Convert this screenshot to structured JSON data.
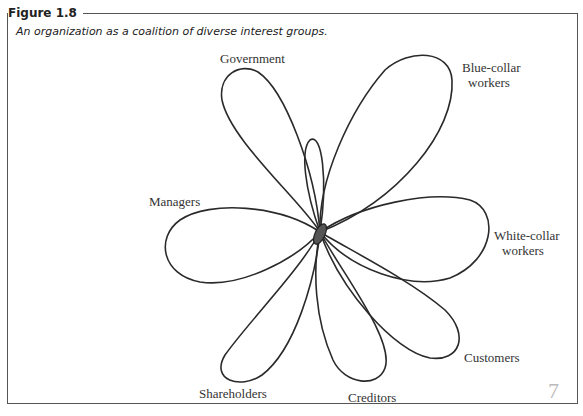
{
  "figure": {
    "number": "Figure 1.8",
    "caption": "An organization as a coalition of diverse interest groups."
  },
  "diagram": {
    "center": "organization",
    "groups": [
      {
        "label": "Government",
        "lines": [
          "Government"
        ]
      },
      {
        "label": "Blue-collar workers",
        "lines": [
          "Blue-collar",
          "workers"
        ]
      },
      {
        "label": "Managers",
        "lines": [
          "Managers"
        ]
      },
      {
        "label": "White-collar workers",
        "lines": [
          "White-collar",
          "workers"
        ]
      },
      {
        "label": "Customers",
        "lines": [
          "Customers"
        ]
      },
      {
        "label": "Shareholders",
        "lines": [
          "Shareholders"
        ]
      },
      {
        "label": "Creditors",
        "lines": [
          "Creditors"
        ]
      }
    ]
  },
  "margin_mark": "7"
}
